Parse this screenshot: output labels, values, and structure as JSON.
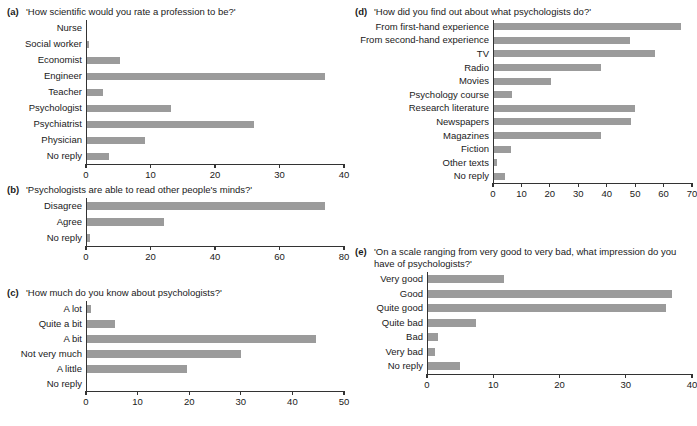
{
  "figure": {
    "background": "#ffffff",
    "bar_color": "#9b9b9b",
    "axis_color": "#333333"
  },
  "panels": {
    "a": {
      "letter": "(a)",
      "question": "'How scientific would you rate a profession to be?'"
    },
    "b": {
      "letter": "(b)",
      "question": "'Psychologists are able to read other people's minds?'"
    },
    "c": {
      "letter": "(c)",
      "question": "'How much do you know about psychologists?'"
    },
    "d": {
      "letter": "(d)",
      "question": "'How did you find out about what psychologists do?'"
    },
    "e": {
      "letter": "(e)",
      "question": "'On a scale ranging from very good to very bad, what impression do you have of psychologists?'"
    }
  },
  "chart_data": [
    {
      "id": "a",
      "type": "bar",
      "orientation": "horizontal",
      "title": "'How scientific would you rate a profession to be?'",
      "xlabel": "",
      "ylabel": "",
      "xlim": [
        0,
        40
      ],
      "xticks": [
        0,
        10,
        20,
        30,
        40
      ],
      "grid": false,
      "legend": false,
      "categories": [
        "Nurse",
        "Social worker",
        "Economist",
        "Engineer",
        "Teacher",
        "Psychologist",
        "Psychiatrist",
        "Physician",
        "No reply"
      ],
      "values": [
        0,
        0.3,
        5.2,
        37,
        2.5,
        13,
        26,
        9,
        3.5
      ]
    },
    {
      "id": "b",
      "type": "bar",
      "orientation": "horizontal",
      "title": "'Psychologists are able to read other people's minds?'",
      "xlabel": "",
      "ylabel": "",
      "xlim": [
        0,
        80
      ],
      "xticks": [
        0,
        20,
        40,
        60,
        80
      ],
      "grid": false,
      "legend": false,
      "categories": [
        "Disagree",
        "Agree",
        "No reply"
      ],
      "values": [
        74,
        24,
        1
      ]
    },
    {
      "id": "c",
      "type": "bar",
      "orientation": "horizontal",
      "title": "'How much do you know about psychologists?'",
      "xlabel": "",
      "ylabel": "",
      "xlim": [
        0,
        50
      ],
      "xticks": [
        0,
        10,
        20,
        30,
        40,
        50
      ],
      "grid": false,
      "legend": false,
      "categories": [
        "A lot",
        "Quite a bit",
        "A bit",
        "Not very much",
        "A little",
        "No reply"
      ],
      "values": [
        0.8,
        5.5,
        44.5,
        30,
        19.5,
        0
      ]
    },
    {
      "id": "d",
      "type": "bar",
      "orientation": "horizontal",
      "title": "'How did you find out about what psychologists do?'",
      "xlabel": "",
      "ylabel": "",
      "xlim": [
        0,
        70
      ],
      "xticks": [
        0,
        10,
        20,
        30,
        40,
        50,
        60,
        70
      ],
      "grid": false,
      "legend": false,
      "categories": [
        "From first-hand experience",
        "From second-hand experience",
        "TV",
        "Radio",
        "Movies",
        "Psychology course",
        "Research literature",
        "Newspapers",
        "Magazines",
        "Fiction",
        "Other texts",
        "No reply"
      ],
      "values": [
        66,
        48,
        57,
        38,
        20,
        6.5,
        50,
        48.5,
        38,
        6,
        1,
        4
      ]
    },
    {
      "id": "e",
      "type": "bar",
      "orientation": "horizontal",
      "title": "'On a scale ranging from very good to very bad, what impression do you have of psychologists?'",
      "xlabel": "",
      "ylabel": "",
      "xlim": [
        0,
        40
      ],
      "xticks": [
        0,
        10,
        20,
        30,
        40
      ],
      "grid": false,
      "legend": false,
      "categories": [
        "Very good",
        "Good",
        "Quite good",
        "Quite bad",
        "Bad",
        "Very bad",
        "No reply"
      ],
      "values": [
        11.5,
        37,
        36,
        7.3,
        1.5,
        1,
        4.8
      ]
    }
  ]
}
